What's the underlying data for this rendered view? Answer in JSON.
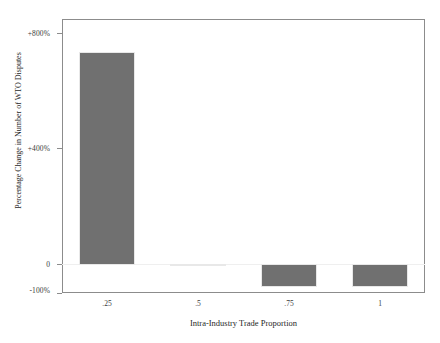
{
  "chart_data": {
    "type": "bar",
    "title": "",
    "subtitle": "",
    "xlabel": "Intra-Industry Trade Proportion",
    "ylabel": "Percentage Change in Number of WTO Disputes",
    "categories": [
      ".25",
      ".5",
      ".75",
      "1"
    ],
    "values": [
      745,
      2,
      -80,
      -80
    ],
    "value_unit": "percent",
    "series": [
      {
        "name": "Percentage Change in Number of WTO Disputes",
        "values": [
          745,
          2,
          -80,
          -80
        ]
      }
    ],
    "ylim": [
      -100,
      860
    ],
    "xlim": [
      0.125,
      1.125
    ],
    "yticks": [
      -100,
      0,
      400,
      800
    ],
    "ytick_labels": [
      "-100%",
      "0",
      "+400%",
      "+800%"
    ],
    "xtick_labels": [
      ".25",
      ".5",
      ".75",
      "1"
    ],
    "grid": false,
    "legend": false,
    "legend_position": "none",
    "bar_color": "#707070",
    "bar_edge_color": "#e8e8e8",
    "frame_color": "#8c8c8c",
    "background_color": "#ffffff",
    "zero_line": true,
    "annotations": []
  },
  "axes": {
    "y_ticks": [
      {
        "label": "+800%",
        "value": 800
      },
      {
        "label": "+400%",
        "value": 400
      },
      {
        "label": "0",
        "value": 0
      },
      {
        "label": "-100%",
        "value": -100
      }
    ],
    "x_ticks": [
      {
        "label": ".25",
        "value": 0.25
      },
      {
        "label": ".5",
        "value": 0.5
      },
      {
        "label": ".75",
        "value": 0.75
      },
      {
        "label": "1",
        "value": 1
      }
    ],
    "y_title": "Percentage Change in Number of WTO Disputes",
    "x_title": "Intra-Industry Trade Proportion"
  }
}
